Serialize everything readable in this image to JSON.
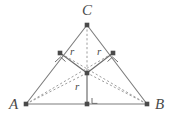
{
  "figure": {
    "type": "geometry-diagram",
    "background_color": "#ffffff",
    "stroke_color": "#7d7d7d",
    "dash_color": "#9a9a9a",
    "point_color": "#4a4a4a",
    "text_color": "#4a4a4a",
    "width": 174,
    "height": 121
  },
  "labels": {
    "vertex_a": "A",
    "vertex_b": "B",
    "vertex_c": "C",
    "radius_left": "r",
    "radius_right": "r",
    "radius_bottom": "r"
  },
  "points": {
    "a": {
      "name": "A",
      "x": 26,
      "y": 104
    },
    "b": {
      "name": "B",
      "x": 147,
      "y": 104
    },
    "c": {
      "name": "C",
      "x": 87,
      "y": 25
    },
    "incenter": {
      "name": "I",
      "x": 87,
      "y": 73
    },
    "tangent_left": {
      "name": "T1",
      "x": 60,
      "y": 53
    },
    "tangent_right": {
      "name": "T2",
      "x": 113,
      "y": 53
    },
    "foot_base": {
      "name": "M",
      "x": 87,
      "y": 104
    }
  },
  "segments": {
    "side_ca": {
      "style": "solid",
      "from": "c",
      "to": "a"
    },
    "side_cb": {
      "style": "solid",
      "from": "c",
      "to": "b"
    },
    "side_ab": {
      "style": "solid",
      "from": "a",
      "to": "b"
    },
    "radius_to_left_tangent": {
      "style": "solid",
      "from": "incenter",
      "to": "tangent_left"
    },
    "radius_to_right_tangent": {
      "style": "solid",
      "from": "incenter",
      "to": "tangent_right"
    },
    "radius_to_base": {
      "style": "solid",
      "from": "incenter",
      "to": "foot_base"
    },
    "bisector_c": {
      "style": "dashed",
      "from": "c",
      "to": "incenter"
    },
    "bisector_a": {
      "style": "dashed",
      "from": "a",
      "to": "incenter"
    },
    "bisector_b": {
      "style": "dashed",
      "from": "b",
      "to": "incenter"
    },
    "chord_left": {
      "style": "dashed",
      "from": "a",
      "to": "tangent_right"
    },
    "chord_right": {
      "style": "dashed",
      "from": "b",
      "to": "tangent_left"
    }
  },
  "marks": {
    "right_angle_left": "right-angle-mark",
    "right_angle_right": "right-angle-mark",
    "right_angle_base": "right-angle-mark"
  }
}
